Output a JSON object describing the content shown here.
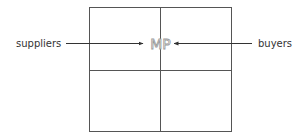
{
  "diagram": {
    "center_label": "MP",
    "left_label": "suppliers",
    "right_label": "buyers",
    "grid": {
      "rows": 2,
      "cols": 2
    },
    "colors": {
      "line": "#555555",
      "text": "#333333",
      "center_text_outline": "#9a9a9a"
    }
  }
}
